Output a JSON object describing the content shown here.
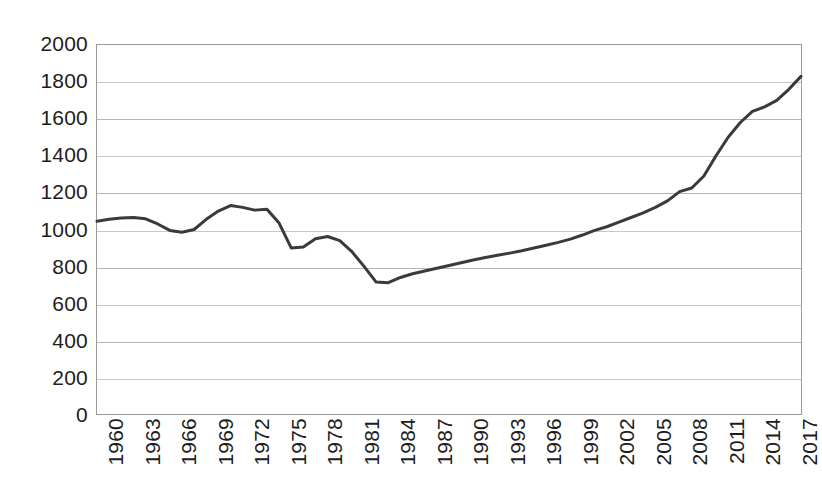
{
  "chart_data": {
    "type": "line",
    "title": "",
    "subtitle": "",
    "xlabel": "",
    "ylabel": "",
    "xlim": [
      1960,
      2018
    ],
    "ylim": [
      0,
      2000
    ],
    "grid": true,
    "legend": false,
    "legend_position": "none",
    "line_color": "#3a3a3a",
    "gridline_color": "#b4b4b4",
    "axis_color": "#9a9a9a",
    "text_color": "#1d1d1d",
    "x_tick_step": 3,
    "y_tick_step": 200,
    "y_ticks": [
      2000,
      1800,
      1600,
      1400,
      1200,
      1000,
      800,
      600,
      400,
      200,
      0
    ],
    "x_ticks": [
      1960,
      1963,
      1966,
      1969,
      1972,
      1975,
      1978,
      1981,
      1984,
      1987,
      1990,
      1993,
      1996,
      1999,
      2002,
      2005,
      2008,
      2011,
      2014,
      2017
    ],
    "x": [
      1960,
      1961,
      1962,
      1963,
      1964,
      1965,
      1966,
      1967,
      1968,
      1969,
      1970,
      1971,
      1972,
      1973,
      1974,
      1975,
      1976,
      1977,
      1978,
      1979,
      1980,
      1981,
      1982,
      1983,
      1984,
      1985,
      1986,
      1987,
      1988,
      1989,
      1990,
      1991,
      1992,
      1993,
      1994,
      1995,
      1996,
      1997,
      1998,
      1999,
      2000,
      2001,
      2002,
      2003,
      2004,
      2005,
      2006,
      2007,
      2008,
      2009,
      2010,
      2011,
      2012,
      2013,
      2014,
      2015,
      2016,
      2017,
      2018
    ],
    "values": [
      1045,
      1055,
      1062,
      1065,
      1058,
      1030,
      995,
      985,
      1000,
      1055,
      1100,
      1130,
      1120,
      1105,
      1110,
      1035,
      900,
      905,
      950,
      962,
      940,
      880,
      800,
      715,
      712,
      740,
      760,
      775,
      790,
      805,
      820,
      835,
      848,
      860,
      872,
      885,
      900,
      915,
      930,
      948,
      970,
      995,
      1015,
      1040,
      1065,
      1090,
      1120,
      1155,
      1205,
      1225,
      1290,
      1400,
      1500,
      1580,
      1640,
      1665,
      1700,
      1760,
      1830
    ],
    "series": [
      {
        "name": "value",
        "values": [
          1045,
          1055,
          1062,
          1065,
          1058,
          1030,
          995,
          985,
          1000,
          1055,
          1100,
          1130,
          1120,
          1105,
          1110,
          1035,
          900,
          905,
          950,
          962,
          940,
          880,
          800,
          715,
          712,
          740,
          760,
          775,
          790,
          805,
          820,
          835,
          848,
          860,
          872,
          885,
          900,
          915,
          930,
          948,
          970,
          995,
          1015,
          1040,
          1065,
          1090,
          1120,
          1155,
          1205,
          1225,
          1290,
          1400,
          1500,
          1580,
          1640,
          1665,
          1700,
          1760,
          1830
        ]
      }
    ]
  }
}
